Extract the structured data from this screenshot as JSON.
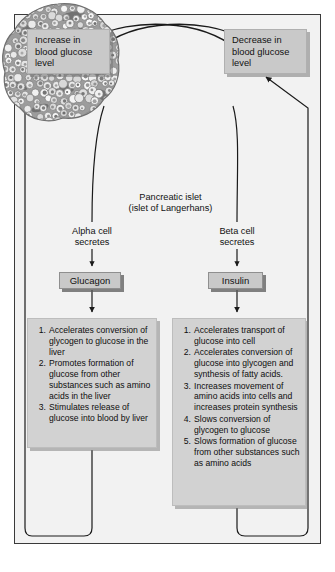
{
  "figure": {
    "background_color": "#f2f2f2",
    "frame_color": "#3a3a3a",
    "box_fill": "#c9c9c9",
    "effects_box_fill": "#d2d2d2",
    "line_color": "#1a1a1a"
  },
  "boxes": {
    "increase": {
      "line1": "Increase in",
      "line2": "blood glucose",
      "line3": "level"
    },
    "decrease": {
      "line1": "Decrease in",
      "line2": "blood glucose",
      "line3": "level"
    }
  },
  "islet": {
    "caption_line1": "Pancreatic islet",
    "caption_line2": "(islet of Langerhans)",
    "image_type": "histology-micrograph"
  },
  "cells": {
    "alpha": {
      "line1": "Alpha cell",
      "line2": "secretes"
    },
    "beta": {
      "line1": "Beta cell",
      "line2": "secretes"
    }
  },
  "hormones": {
    "glucagon": "Glucagon",
    "insulin": "Insulin"
  },
  "glucagon_effects": [
    {
      "num": "1.",
      "text": "Accelerates conversion of glycogen to glucose in the liver"
    },
    {
      "num": "2.",
      "text": "Promotes formation of glucose from other substances such as amino acids in the liver"
    },
    {
      "num": "3.",
      "text": "Stimulates release of glucose into blood by liver"
    }
  ],
  "insulin_effects": [
    {
      "num": "1.",
      "text": "Accelerates transport of glucose into cell"
    },
    {
      "num": "2.",
      "text": "Accelerates conversion of glucose into glycogen and synthesis of fatty acids."
    },
    {
      "num": "3.",
      "text": "Increases movement of amino acids into cells and increases protein synthesis"
    },
    {
      "num": "4.",
      "text": "Slows conversion of glycogen to glucose"
    },
    {
      "num": "5.",
      "text": "Slows formation of glucose from other substances such as amino acids"
    }
  ]
}
